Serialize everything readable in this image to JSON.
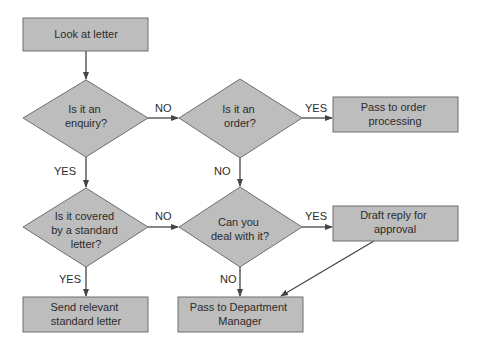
{
  "diagram": {
    "type": "flowchart",
    "colors": {
      "fill": "#bdbdbd",
      "stroke": "#6e6e6e",
      "line": "#444444",
      "text": "#2b2b2b"
    },
    "nodes": {
      "look": {
        "shape": "process",
        "lines": [
          "Look at letter"
        ]
      },
      "enquiry": {
        "shape": "decision",
        "lines": [
          "Is it an",
          "enquiry?"
        ]
      },
      "order": {
        "shape": "decision",
        "lines": [
          "Is it an",
          "order?"
        ]
      },
      "pass_order": {
        "shape": "process",
        "lines": [
          "Pass to order",
          "processing"
        ]
      },
      "standard": {
        "shape": "decision",
        "lines": [
          "Is it covered",
          "by a standard",
          "letter?"
        ]
      },
      "deal": {
        "shape": "decision",
        "lines": [
          "Can you",
          "deal with it?"
        ]
      },
      "draft": {
        "shape": "process",
        "lines": [
          "Draft reply for",
          "approval"
        ]
      },
      "send": {
        "shape": "process",
        "lines": [
          "Send relevant",
          "standard letter"
        ]
      },
      "manager": {
        "shape": "process",
        "lines": [
          "Pass to Department",
          "Manager"
        ]
      }
    },
    "edges": {
      "look_enquiry": {
        "from": "look",
        "to": "enquiry",
        "label": ""
      },
      "enquiry_order": {
        "from": "enquiry",
        "to": "order",
        "label": "NO"
      },
      "order_pass": {
        "from": "order",
        "to": "pass_order",
        "label": "YES"
      },
      "enquiry_standard": {
        "from": "enquiry",
        "to": "standard",
        "label": "YES"
      },
      "order_deal": {
        "from": "order",
        "to": "deal",
        "label": "NO"
      },
      "standard_deal": {
        "from": "standard",
        "to": "deal",
        "label": "NO"
      },
      "deal_draft": {
        "from": "deal",
        "to": "draft",
        "label": "YES"
      },
      "standard_send": {
        "from": "standard",
        "to": "send",
        "label": "YES"
      },
      "deal_manager": {
        "from": "deal",
        "to": "manager",
        "label": "NO"
      },
      "draft_manager": {
        "from": "draft",
        "to": "manager",
        "label": ""
      }
    }
  }
}
